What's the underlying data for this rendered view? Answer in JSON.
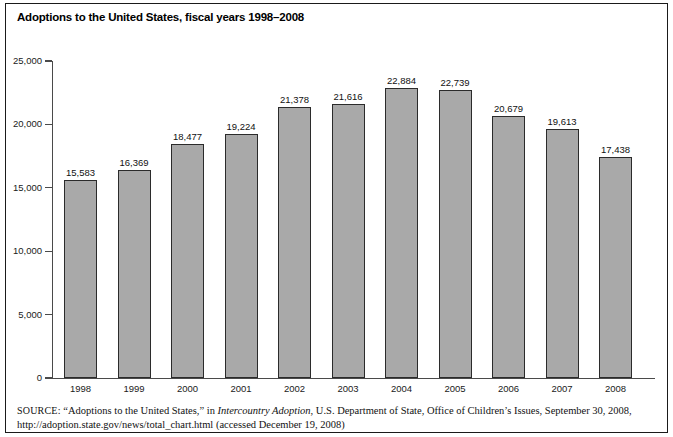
{
  "figure": {
    "title": "Adoptions to the United States, fiscal years 1998–2008",
    "source_prefix": "SOURCE:",
    "source_quoted_title": "“Adoptions to the United States,”",
    "source_in": "in",
    "source_publication": "Intercountry Adoption",
    "source_rest": ", U.S. Department of State, Office of Children’s Issues, September 30, 2008, http://adoption.state.gov/news/total_chart.html (accessed December 19, 2008)",
    "frame_color": "#1a1a1a",
    "bar_fill": "#a9a9a9",
    "bar_stroke": "#2b2b2b",
    "axis_color": "#4a4a4a"
  },
  "chart_data": {
    "type": "bar",
    "title": "Adoptions to the United States, fiscal years 1998–2008",
    "xlabel": "",
    "ylabel": "",
    "categories": [
      "1998",
      "1999",
      "2000",
      "2001",
      "2002",
      "2003",
      "2004",
      "2005",
      "2006",
      "2007",
      "2008"
    ],
    "values": [
      15583,
      16369,
      18477,
      19224,
      21378,
      21616,
      22884,
      22739,
      20679,
      19613,
      17438
    ],
    "value_labels": [
      "15,583",
      "16,369",
      "18,477",
      "19,224",
      "21,378",
      "21,616",
      "22,884",
      "22,739",
      "20,679",
      "19,613",
      "17,438"
    ],
    "ylim": [
      0,
      25000
    ],
    "ytick_values": [
      0,
      5000,
      10000,
      15000,
      20000,
      25000
    ],
    "ytick_labels": [
      "0",
      "5,000",
      "10,000",
      "15,000",
      "20,000",
      "25,000"
    ],
    "grid": false,
    "legend": null,
    "series": [
      {
        "name": "Adoptions to the United States",
        "values": [
          15583,
          16369,
          18477,
          19224,
          21378,
          21616,
          22884,
          22739,
          20679,
          19613,
          17438
        ]
      }
    ]
  }
}
